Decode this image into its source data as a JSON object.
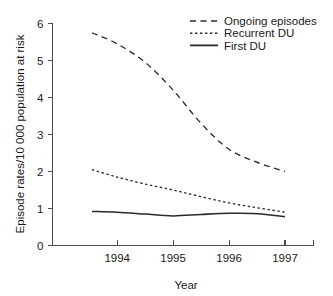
{
  "chart_data": {
    "type": "line",
    "title": "",
    "xlabel": "Year",
    "ylabel": "Episode rates/10 000 population at risk",
    "xlim": [
      1993.55,
      1997.45
    ],
    "ylim": [
      0,
      6
    ],
    "yticks": [
      0,
      1,
      2,
      3,
      4,
      5,
      6
    ],
    "ytick_labels": [
      "0",
      "1",
      "2",
      "3",
      "4",
      "5",
      "6"
    ],
    "xticks": [
      1994,
      1995,
      1996,
      1997
    ],
    "xtick_labels": [
      "1994",
      "1995",
      "1996",
      "1997"
    ],
    "grid": false,
    "legend_position": "top-right",
    "x": [
      1993.55,
      1994,
      1994.5,
      1995,
      1995.5,
      1996,
      1996.5,
      1997
    ],
    "series": [
      {
        "name": "Ongoing episodes",
        "style": "dashed",
        "color": "#2b2b2b",
        "values": [
          5.75,
          5.45,
          4.95,
          4.2,
          3.3,
          2.6,
          2.25,
          2.0
        ]
      },
      {
        "name": "Recurrent DU",
        "style": "dotted",
        "color": "#2b2b2b",
        "values": [
          2.05,
          1.85,
          1.66,
          1.5,
          1.32,
          1.15,
          1.02,
          0.9
        ]
      },
      {
        "name": "First DU",
        "style": "solid",
        "color": "#2b2b2b",
        "values": [
          0.92,
          0.9,
          0.85,
          0.8,
          0.84,
          0.87,
          0.86,
          0.78
        ]
      }
    ]
  },
  "legend": {
    "items": [
      {
        "label": "Ongoing episodes",
        "style": "dashed"
      },
      {
        "label": "Recurrent DU",
        "style": "dotted"
      },
      {
        "label": "First DU",
        "style": "solid"
      }
    ]
  },
  "axes": {
    "x_title": "Year",
    "y_title": "Episode rates/10 000 population at risk"
  }
}
